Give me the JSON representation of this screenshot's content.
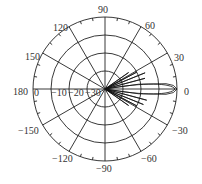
{
  "chart_data": {
    "type": "polar",
    "title": "",
    "angle_unit": "degrees",
    "angular_ticks": [
      90,
      60,
      30,
      0,
      -30,
      -60,
      -90,
      -120,
      -150,
      180,
      150,
      120
    ],
    "angular_tick_labels": [
      "90",
      "60",
      "30",
      "0",
      "-30",
      "-60",
      "-90",
      "-120",
      "-150",
      "180",
      "150",
      "120"
    ],
    "radial_ticks": [
      0,
      -10,
      -20,
      -30
    ],
    "radial_tick_labels": [
      "0",
      "-10",
      "-20",
      "-30"
    ],
    "radial_range": [
      -40,
      0
    ],
    "radial_unit": "dB",
    "grid": true,
    "legend": null,
    "series": [
      {
        "name": "radiation pattern",
        "theta": [
          -40,
          -35,
          -32,
          -28,
          -25,
          -22,
          -18,
          -15,
          -12,
          -8,
          -5,
          -3,
          0,
          3,
          5,
          8,
          12,
          15,
          18,
          22,
          25,
          28,
          32,
          35,
          40
        ],
        "r_db": [
          -40,
          -24,
          -40,
          -20,
          -40,
          -17,
          -40,
          -16,
          -40,
          -21,
          -6,
          -2,
          0,
          -2,
          -6,
          -21,
          -40,
          -17,
          -40,
          -16,
          -40,
          -20,
          -40,
          -24,
          -40
        ]
      }
    ]
  },
  "labels": {
    "a90": "90",
    "a60": "60",
    "a30": "30",
    "a0": "0",
    "am30": "−30",
    "am60": "−60",
    "am90": "−90",
    "am120": "−120",
    "am150": "−150",
    "a180": "180",
    "a150": "150",
    "a120": "120",
    "r0": "0",
    "r10": "−10",
    "r20": "−20",
    "r30": "−30"
  }
}
